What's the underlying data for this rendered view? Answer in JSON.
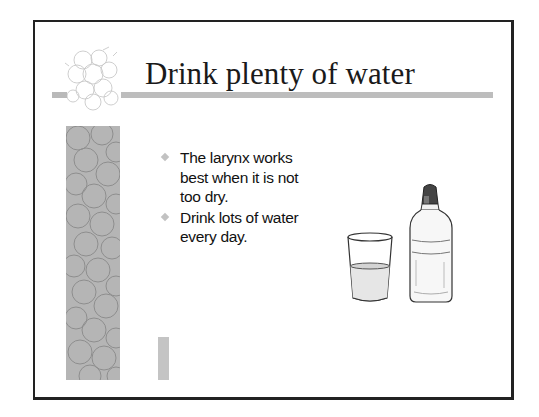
{
  "slide": {
    "title": "Drink plenty of water",
    "bullets": [
      {
        "text": "The larynx works best when it is not too dry."
      },
      {
        "text": "Drink lots of water every day."
      }
    ],
    "bullet_icon": "diamond-bullet-icon",
    "illustration": {
      "items": [
        "glass-of-water",
        "water-bottle"
      ]
    }
  },
  "theme": {
    "frame_color": "#222222",
    "accent_bar_color": "#bdbdbd",
    "strip_color": "#b5b5b5",
    "bullet_color": "#c2c2c2",
    "text_color": "#111111"
  }
}
